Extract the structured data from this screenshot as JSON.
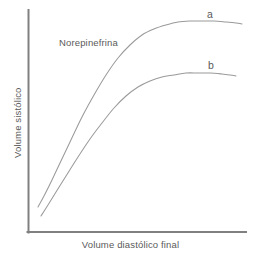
{
  "figure": {
    "axes": {
      "x_title": "Volume diastólico final",
      "y_title": "Volume sistólico",
      "axis_color": "#808080",
      "origin": [
        28,
        232
      ],
      "x_axis_end": [
        246,
        232
      ],
      "y_axis_top": [
        28,
        10
      ]
    },
    "annotations": [
      {
        "name": "norepinefrina-label",
        "text": "Norepinefrina",
        "x": 59,
        "y": 38
      }
    ],
    "curve_labels": [
      {
        "name": "curve-a-label",
        "text": "a",
        "x": 207,
        "y": 9
      },
      {
        "name": "curve-b-label",
        "text": "b",
        "x": 208,
        "y": 60
      }
    ],
    "colors": {
      "curve": "#9a9a9a",
      "axis": "#808080",
      "text": "#5a5a5a",
      "background": "#ffffff"
    }
  },
  "chart_data": {
    "type": "line",
    "title": "",
    "subtitle": "",
    "xlabel": "Volume diastólico final",
    "ylabel": "Volume sistólico",
    "xlim": [
      0,
      100
    ],
    "ylim": [
      0,
      100
    ],
    "grid": false,
    "axis_ticks": false,
    "legend": "inline-curve-labels",
    "annotations": [
      "Norepinefrina"
    ],
    "series": [
      {
        "name": "a",
        "label": "a",
        "description": "Curva com norepinefrina (efeito inotrópico positivo)",
        "color": "#9a9a9a",
        "points_px": [
          [
            38,
            207
          ],
          [
            44,
            196
          ],
          [
            52,
            180
          ],
          [
            60,
            163
          ],
          [
            70,
            142
          ],
          [
            82,
            117
          ],
          [
            94,
            95
          ],
          [
            106,
            75
          ],
          [
            118,
            58
          ],
          [
            130,
            45
          ],
          [
            142,
            35
          ],
          [
            154,
            29
          ],
          [
            166,
            25
          ],
          [
            178,
            22
          ],
          [
            190,
            21
          ],
          [
            202,
            21
          ],
          [
            214,
            21
          ],
          [
            226,
            22
          ],
          [
            236,
            23
          ],
          [
            242,
            24
          ]
        ],
        "x": [
          5,
          8,
          11,
          15,
          19,
          24,
          30,
          36,
          42,
          47,
          52,
          58,
          63,
          69,
          74,
          80,
          85,
          91,
          95,
          98
        ],
        "y": [
          11,
          16,
          23,
          30,
          39,
          50,
          59,
          68,
          75,
          81,
          85,
          88,
          89,
          91,
          91,
          91,
          91,
          91,
          90,
          89
        ]
      },
      {
        "name": "b",
        "label": "b",
        "description": "Curva controle (sem norepinefrina)",
        "color": "#9a9a9a",
        "points_px": [
          [
            41,
            216
          ],
          [
            48,
            205
          ],
          [
            56,
            192
          ],
          [
            66,
            176
          ],
          [
            78,
            157
          ],
          [
            90,
            139
          ],
          [
            102,
            123
          ],
          [
            114,
            108
          ],
          [
            126,
            96
          ],
          [
            138,
            87
          ],
          [
            150,
            81
          ],
          [
            162,
            77
          ],
          [
            174,
            75
          ],
          [
            186,
            73
          ],
          [
            198,
            73
          ],
          [
            210,
            73
          ],
          [
            222,
            74
          ],
          [
            230,
            75
          ],
          [
            236,
            76
          ]
        ],
        "x": [
          6,
          9,
          13,
          18,
          23,
          29,
          35,
          41,
          46,
          52,
          58,
          63,
          69,
          74,
          80,
          85,
          91,
          94,
          97
        ],
        "y": [
          7,
          12,
          18,
          25,
          33,
          41,
          48,
          55,
          60,
          64,
          67,
          68,
          69,
          70,
          70,
          70,
          69,
          69,
          68
        ]
      }
    ]
  }
}
